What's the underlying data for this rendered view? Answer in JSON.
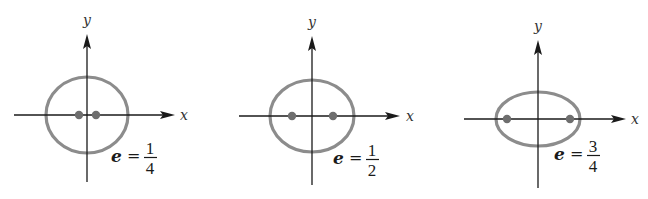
{
  "figure": {
    "panels": [
      {
        "id": "panel-1",
        "x_axis_label": "x",
        "y_axis_label": "y",
        "eccentricity_symbol": "e",
        "equals": "=",
        "numerator": "1",
        "denominator": "4",
        "geometry": {
          "cx": 87,
          "cy": 115,
          "rx": 41,
          "ry": 38,
          "foci": [
            79,
            96
          ],
          "xaxis": [
            14,
            175
          ],
          "yaxis": [
            182,
            34
          ],
          "xlabel_pos": [
            180,
            120
          ],
          "ylabel_pos": [
            83,
            25
          ],
          "label_pos": [
            111,
            162
          ]
        }
      },
      {
        "id": "panel-2",
        "x_axis_label": "x",
        "y_axis_label": "y",
        "eccentricity_symbol": "e",
        "equals": "=",
        "numerator": "1",
        "denominator": "2",
        "geometry": {
          "cx": 312,
          "cy": 116,
          "rx": 42,
          "ry": 36,
          "foci": [
            292,
            333
          ],
          "xaxis": [
            239,
            400
          ],
          "yaxis": [
            185,
            36
          ],
          "xlabel_pos": [
            406,
            121
          ],
          "ylabel_pos": [
            308,
            27
          ],
          "label_pos": [
            333,
            164
          ]
        }
      },
      {
        "id": "panel-3",
        "x_axis_label": "x",
        "y_axis_label": "y",
        "eccentricity_symbol": "e",
        "equals": "=",
        "numerator": "3",
        "denominator": "4",
        "geometry": {
          "cx": 538,
          "cy": 119,
          "rx": 42,
          "ry": 27,
          "foci": [
            507,
            570
          ],
          "xaxis": [
            464,
            626
          ],
          "yaxis": [
            188,
            40
          ],
          "xlabel_pos": [
            631,
            124
          ],
          "ylabel_pos": [
            534,
            31
          ],
          "label_pos": [
            554,
            160
          ]
        }
      }
    ],
    "colors": {
      "ellipse": "#8c8c8c",
      "focus": "#6e6e6e",
      "axis": "#1a1a1a",
      "background": "#ffffff"
    }
  }
}
